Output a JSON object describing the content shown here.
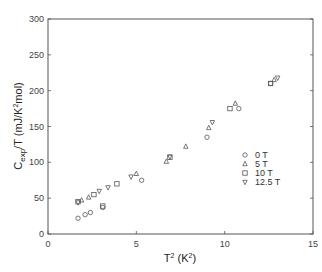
{
  "chart_data": {
    "type": "scatter",
    "title": "",
    "xlabel": "T² (K²)",
    "ylabel": "C_exp/T (mJ/K²mol)",
    "xlim": [
      0,
      15
    ],
    "ylim": [
      0,
      300
    ],
    "x_ticks": [
      0,
      5,
      10,
      15
    ],
    "y_ticks": [
      0,
      50,
      100,
      150,
      200,
      250,
      300
    ],
    "grid": false,
    "legend_position": "lower right (inside plot)",
    "series": [
      {
        "name": "0 T",
        "marker": "circle",
        "x": [
          1.7,
          2.1,
          2.4,
          3.1,
          5.3,
          9.0,
          10.8,
          12.6
        ],
        "y": [
          22,
          27,
          30,
          37,
          75,
          135,
          175,
          210
        ]
      },
      {
        "name": "5 T",
        "marker": "triangle-up",
        "x": [
          1.9,
          2.3,
          5.0,
          6.7,
          7.8,
          9.1,
          10.6,
          12.8
        ],
        "y": [
          47,
          51,
          84,
          101,
          122,
          148,
          182,
          215
        ]
      },
      {
        "name": "10 T",
        "marker": "square",
        "x": [
          1.7,
          2.6,
          3.1,
          3.9,
          6.9,
          10.3,
          12.6
        ],
        "y": [
          45,
          55,
          39,
          70,
          107,
          175,
          210
        ]
      },
      {
        "name": "12.5 T",
        "marker": "triangle-down",
        "x": [
          1.7,
          2.9,
          3.4,
          4.7,
          6.9,
          9.3,
          13.0
        ],
        "y": [
          44,
          60,
          65,
          80,
          108,
          156,
          218
        ]
      }
    ]
  },
  "axes": {
    "x_tick_labels": [
      "0",
      "5",
      "10",
      "15"
    ],
    "y_tick_labels": [
      "0",
      "50",
      "100",
      "150",
      "200",
      "250",
      "300"
    ],
    "x_title_main": "T",
    "x_title_sup": "2",
    "x_title_unit_open": " (K",
    "x_title_unit_sup": "2",
    "x_title_unit_close": ")",
    "y_title": "C",
    "y_title_sub": "exp",
    "y_title_rest": "/T (mJ/K",
    "y_title_sup": "2",
    "y_title_end": "mol)"
  },
  "legend": {
    "items": [
      {
        "label": "0 T",
        "marker": "circle"
      },
      {
        "label": "5 T",
        "marker": "triangle-up"
      },
      {
        "label": "10 T",
        "marker": "square"
      },
      {
        "label": "12.5 T",
        "marker": "triangle-down"
      }
    ]
  }
}
